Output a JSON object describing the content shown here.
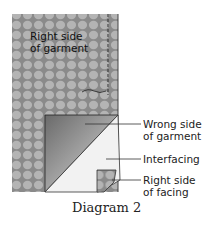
{
  "labels": {
    "right_side_garment": "Right side\nof garment",
    "wrong_side_garment": "Wrong side\nof garment",
    "interfacing": "Interfacing",
    "right_side_facing": "Right side\nof facing"
  },
  "caption": "Diagram 2",
  "colors": {
    "fabric_base": "#8a8a8a",
    "fabric_cell": "#b4b4b4",
    "wrong_side_dark": "#707070",
    "wrong_side_light": "#d8d8d8",
    "interfacing": "#f2f2f2",
    "line": "#333333"
  }
}
